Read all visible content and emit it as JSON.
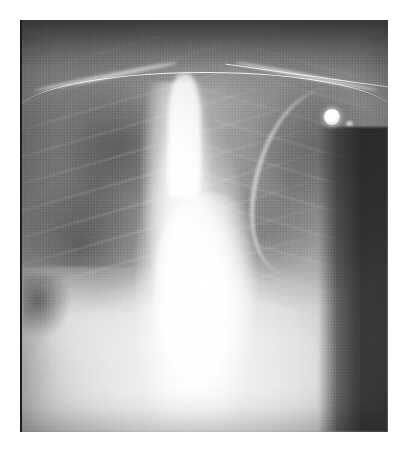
{
  "document": {
    "type": "radiograph",
    "modality": "X-ray",
    "body_part": "Chest",
    "projection": "AP (portable)",
    "title": "Chest radiograph",
    "background_color": "#ffffff"
  },
  "plate": {
    "left": 22,
    "top": 20,
    "width": 366,
    "height": 412,
    "tone_darkest_hex": "#1f1f1f",
    "tone_dark_hex": "#3a3a3a",
    "tone_mid_hex": "#8d8d8d",
    "tone_light_hex": "#c9c9c9",
    "tone_brightest_hex": "#ffffff"
  },
  "edge_artifacts": {
    "dark_strip_label": "film dark border strip",
    "bright_strip_label": "film bright border strip"
  },
  "regions": [
    {
      "name": "apices-and-supraclavicular",
      "tone": "dark",
      "note": "darker band across top of film"
    },
    {
      "name": "right-lung-field",
      "tone": "dark-patchy",
      "note": "viewer left; rib shadows and lung markings visible"
    },
    {
      "name": "left-lung-field",
      "tone": "dark-patchy",
      "note": "viewer right; obscured laterally"
    },
    {
      "name": "mediastinum",
      "tone": "bright",
      "note": "widened, markedly opaque central density"
    },
    {
      "name": "cardiac-silhouette",
      "tone": "bright",
      "note": "enlarged, left border sweeps laterally"
    },
    {
      "name": "trachea-and-upper-mediastinal-stripe",
      "tone": "bright",
      "note": "vertical midline lucency/opacity"
    },
    {
      "name": "diaphragm-and-subdiaphragm",
      "tone": "bright",
      "note": "lower third of film washed bright"
    },
    {
      "name": "costophrenic-angle-right",
      "tone": "dark",
      "note": "dark notch at lower viewer-left"
    },
    {
      "name": "lateral-background-band",
      "tone": "darkest",
      "note": "dark vertical band off the body on viewer right"
    }
  ],
  "anatomy_markers": [
    {
      "name": "clavicle-right",
      "label": "Right clavicle"
    },
    {
      "name": "clavicle-left",
      "label": "Left clavicle"
    },
    {
      "name": "scapula-left",
      "label": "Left scapular border"
    },
    {
      "name": "ribs-right",
      "label": "Right rib cage"
    },
    {
      "name": "ribs-left",
      "label": "Left rib cage"
    }
  ],
  "devices": [
    {
      "name": "ecg-electrode",
      "label": "ECG electrode",
      "appearance": "bright round radio-opaque disc",
      "position": {
        "x_pct": 83,
        "y_pct": 22
      }
    },
    {
      "name": "monitoring-cable",
      "label": "Monitoring lead cable",
      "appearance": "thin bright curved line crossing upper chest"
    }
  ],
  "texture": {
    "grain_label": "scanned film grain",
    "vignette_label": "edge vignette"
  }
}
